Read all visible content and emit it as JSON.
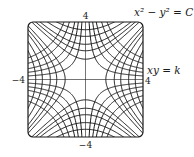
{
  "figure": {
    "type": "contour-families",
    "domain": {
      "xmin": -4,
      "xmax": 4,
      "ymin": -4,
      "ymax": 4
    },
    "tick_labels": {
      "top": "4",
      "bottom": "−4",
      "left": "−4",
      "right": "4"
    },
    "curve_labels": {
      "family1": "x² − y² = C",
      "family2": "xy = k"
    },
    "family1_levels": [
      -12,
      -9,
      -6,
      -4,
      -2,
      2,
      4,
      6,
      9,
      12
    ],
    "family2_levels": [
      -6,
      -4.5,
      -3,
      -2,
      -1,
      1,
      2,
      3,
      4.5,
      6
    ],
    "colors": {
      "line": "#1a1a1a",
      "background": "#ffffff"
    }
  }
}
